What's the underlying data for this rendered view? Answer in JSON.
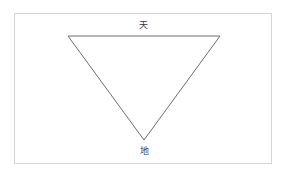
{
  "page": {
    "background_color": "#ffffff",
    "width": 290,
    "height": 179
  },
  "frame": {
    "name": "diagram-border",
    "border_color": "#d5d5d7",
    "fill_color": "#ffffff"
  },
  "diagram": {
    "type": "inverted-triangle",
    "title": "",
    "stroke_color": "#6e6e72",
    "stroke_width": 1,
    "fill": "none",
    "vertices": [
      {
        "name": "top-left",
        "x": 68,
        "y": 36
      },
      {
        "name": "top-right",
        "x": 220,
        "y": 36
      },
      {
        "name": "bottom-apex",
        "x": 144,
        "y": 140
      }
    ],
    "points_attr": "68,36 220,36 144,140 68,36"
  },
  "labels": {
    "top": {
      "text": "天",
      "meaning_position": "above-top-edge",
      "color": "#3a3a3c"
    },
    "bottom": {
      "text": "地",
      "meaning_position": "below-bottom-apex",
      "color": "#3a3a3c"
    }
  }
}
